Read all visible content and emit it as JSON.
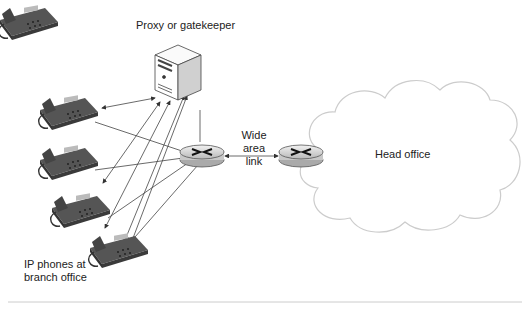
{
  "diagram": {
    "labels": {
      "proxy": "Proxy or gatekeeper",
      "wan_line1": "Wide area",
      "wan_line2": "link",
      "head_office": "Head office",
      "phones_line1": "IP phones at",
      "phones_line2": "branch office"
    },
    "nodes": [
      {
        "id": "proxy",
        "type": "server-icon"
      },
      {
        "id": "branch-router",
        "type": "router-icon"
      },
      {
        "id": "head-router",
        "type": "router-icon"
      },
      {
        "id": "phone-1",
        "type": "ip-phone-icon"
      },
      {
        "id": "phone-2",
        "type": "ip-phone-icon"
      },
      {
        "id": "phone-3",
        "type": "ip-phone-icon"
      },
      {
        "id": "phone-4",
        "type": "ip-phone-icon"
      },
      {
        "id": "head-office",
        "type": "cloud-icon"
      }
    ],
    "colors": {
      "line": "#444444",
      "divider": "#cccccc",
      "phone": "#4a4a4a",
      "router": "#d8d8d8"
    }
  }
}
